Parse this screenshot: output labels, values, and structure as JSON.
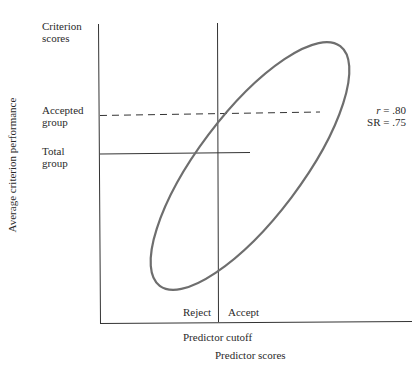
{
  "figure": {
    "y_axis_top_label": [
      "Criterion",
      "scores"
    ],
    "y_axis_rotated_label": "Average criterion performance",
    "accepted_group_label": [
      "Accepted",
      "group"
    ],
    "total_group_label": [
      "Total",
      "group"
    ],
    "stats": {
      "r_label": "r",
      "r_value": " = .80",
      "sr_label": "SR = .75"
    },
    "reject_label": "Reject",
    "accept_label": "Accept",
    "cutoff_label": "Predictor cutoff",
    "x_axis_label": "Predictor scores",
    "colors": {
      "axis": "#333333",
      "ellipse": "#6e6e6e",
      "text": "#2a2a2a"
    }
  }
}
